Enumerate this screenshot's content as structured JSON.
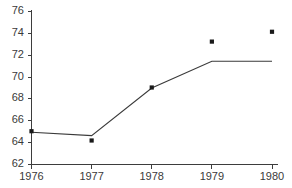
{
  "chart_data": {
    "type": "line",
    "title": "",
    "subtitle": "",
    "xlabel": "",
    "ylabel": "",
    "x": [
      1976,
      1977,
      1978,
      1979,
      1980
    ],
    "xtick_labels": [
      "1976",
      "1977",
      "1978",
      "1979",
      "1980"
    ],
    "ytick_labels": [
      "62",
      "64",
      "66",
      "68",
      "70",
      "72",
      "74",
      "76"
    ],
    "yticks": [
      62,
      64,
      66,
      68,
      70,
      72,
      74,
      76
    ],
    "xlim": [
      1975.85,
      1980.1
    ],
    "ylim": [
      62,
      76
    ],
    "grid": false,
    "legend": false,
    "legend_position": "none",
    "series": [
      {
        "name": "observed",
        "render": "markers",
        "marker": "square",
        "color": "#1a1a1a",
        "values": [
          65.0,
          64.15,
          69.0,
          73.2,
          74.1
        ]
      },
      {
        "name": "fitted",
        "render": "line",
        "color": "#3a3a3a",
        "values": [
          64.9,
          64.6,
          68.95,
          71.4,
          71.4
        ]
      }
    ],
    "annotations": []
  },
  "axes": {
    "y_axis_name": "value-axis",
    "x_axis_name": "year-axis"
  },
  "colors": {
    "axis": "#3d3d3d",
    "line": "#3a3a3a",
    "marker": "#1a1a1a",
    "background": "#ffffff",
    "tick_text": "#3a3a3a"
  }
}
